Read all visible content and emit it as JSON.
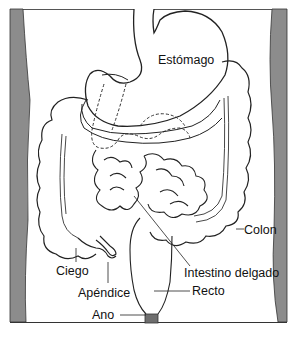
{
  "diagram": {
    "type": "anatomical-illustration",
    "labels": {
      "stomach": "Estómago",
      "colon": "Colon",
      "cecum": "Ciego",
      "small_intestine": "Intestino delgado",
      "appendix": "Apéndice",
      "rectum": "Recto",
      "anus": "Ano"
    },
    "colors": {
      "background": "#ffffff",
      "body_wall": "#8a8a8a",
      "outline": "#2a2a2a",
      "anus_fill": "#6e6e6e"
    }
  }
}
